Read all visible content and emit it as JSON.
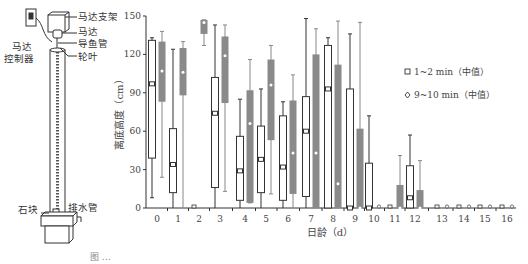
{
  "apparatus": {
    "labels": {
      "motor_bracket": "马达支架",
      "motor": "马达",
      "guide_tube": "导鱼管",
      "impeller": "轮叶",
      "motor_controller_line1": "马达",
      "motor_controller_line2": "控制器",
      "stone": "石块",
      "drain_pipe": "排水管"
    }
  },
  "caption": "图 …",
  "chart_data": {
    "type": "box",
    "title": "",
    "xlabel": "日龄（d）",
    "ylabel": "离底高度（cm）",
    "ylim": [
      0,
      150
    ],
    "yticks": [
      0,
      30,
      60,
      90,
      120,
      150
    ],
    "categories": [
      "0",
      "1",
      "2",
      "3",
      "4",
      "5",
      "6",
      "7",
      "8",
      "9",
      "10",
      "11",
      "12",
      "13",
      "14",
      "15",
      "16"
    ],
    "legend": [
      {
        "marker": "square",
        "label": "1~2 min（中值）"
      },
      {
        "marker": "diamond",
        "label": "9~10 min（中值）"
      }
    ],
    "series": [
      {
        "name": "1~2 min",
        "style": "open",
        "boxes": [
          {
            "min": 8,
            "q1": 39,
            "median": 97,
            "q3": 131,
            "max": 133
          },
          {
            "min": 0,
            "q1": 12,
            "median": 34,
            "q3": 62,
            "max": 124
          },
          {
            "min": 0,
            "q1": 0,
            "median": 0,
            "q3": 0,
            "max": 0
          },
          {
            "min": 0,
            "q1": 16,
            "median": 74,
            "q3": 102,
            "max": 143
          },
          {
            "min": 0,
            "q1": 6,
            "median": 29,
            "q3": 56,
            "max": 85
          },
          {
            "min": 0,
            "q1": 12,
            "median": 38,
            "q3": 64,
            "max": 93
          },
          {
            "min": 0,
            "q1": 6,
            "median": 32,
            "q3": 72,
            "max": 83
          },
          {
            "min": 0,
            "q1": 9,
            "median": 60,
            "q3": 87,
            "max": 148
          },
          {
            "min": 0,
            "q1": 0,
            "median": 93,
            "q3": 127,
            "max": 133
          },
          {
            "min": 0,
            "q1": 0,
            "median": 0,
            "q3": 93,
            "max": 136
          },
          {
            "min": 0,
            "q1": 0,
            "median": 0,
            "q3": 35,
            "max": 72
          },
          {
            "min": 0,
            "q1": 0,
            "median": 0,
            "q3": 0,
            "max": 0
          },
          {
            "min": 0,
            "q1": 0,
            "median": 8,
            "q3": 33,
            "max": 57
          },
          {
            "min": 0,
            "q1": 0,
            "median": 0,
            "q3": 0,
            "max": 0
          },
          {
            "min": 0,
            "q1": 0,
            "median": 0,
            "q3": 0,
            "max": 0
          },
          {
            "min": 0,
            "q1": 0,
            "median": 0,
            "q3": 0,
            "max": 0
          },
          {
            "min": 0,
            "q1": 0,
            "median": 0,
            "q3": 0,
            "max": 0
          }
        ]
      },
      {
        "name": "9~10 min",
        "style": "filled",
        "boxes": [
          {
            "min": 24,
            "q1": 83,
            "median": 107,
            "q3": 130,
            "max": 138
          },
          {
            "min": 0,
            "q1": 88,
            "median": 106,
            "q3": 125,
            "max": 130
          },
          {
            "min": 127,
            "q1": 136,
            "median": 145,
            "q3": 147,
            "max": 147
          },
          {
            "min": 13,
            "q1": 82,
            "median": 119,
            "q3": 134,
            "max": 143
          },
          {
            "min": 4,
            "q1": 4,
            "median": 66,
            "q3": 92,
            "max": 116
          },
          {
            "min": 11,
            "q1": 53,
            "median": 96,
            "q3": 116,
            "max": 127
          },
          {
            "min": 0,
            "q1": 11,
            "median": 43,
            "q3": 84,
            "max": 104
          },
          {
            "min": 0,
            "q1": 0,
            "median": 43,
            "q3": 120,
            "max": 140
          },
          {
            "min": 0,
            "q1": 0,
            "median": 19,
            "q3": 112,
            "max": 146
          },
          {
            "min": 0,
            "q1": 0,
            "median": 0,
            "q3": 62,
            "max": 145
          },
          {
            "min": 0,
            "q1": 0,
            "median": 0,
            "q3": 0,
            "max": 0
          },
          {
            "min": 0,
            "q1": 0,
            "median": 0,
            "q3": 18,
            "max": 41
          },
          {
            "min": 0,
            "q1": 0,
            "median": 0,
            "q3": 14,
            "max": 37
          },
          {
            "min": 0,
            "q1": 0,
            "median": 0,
            "q3": 0,
            "max": 0
          },
          {
            "min": 0,
            "q1": 0,
            "median": 0,
            "q3": 0,
            "max": 0
          },
          {
            "min": 0,
            "q1": 0,
            "median": 0,
            "q3": 0,
            "max": 0
          },
          {
            "min": 0,
            "q1": 0,
            "median": 0,
            "q3": 0,
            "max": 0
          }
        ]
      }
    ],
    "grid": false,
    "legend_position": "right"
  }
}
